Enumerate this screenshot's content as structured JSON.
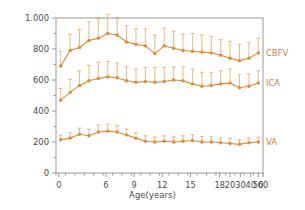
{
  "chart_data": {
    "type": "line",
    "title": "",
    "xlabel": "Age(years)",
    "ylabel": "Flow volumes (ml/min)",
    "ylim": [
      0,
      1000
    ],
    "yticks": [
      0,
      200,
      400,
      600,
      800,
      1000
    ],
    "ytick_labels": [
      "0",
      "200",
      "400",
      "600",
      "800",
      "1.000"
    ],
    "xtick_labels": [
      "0",
      "6",
      "9",
      "12",
      "15",
      "18",
      "20",
      "30",
      "40",
      "50",
      "60"
    ],
    "xtick_values": [
      0,
      6,
      9,
      12,
      15,
      18,
      20,
      30,
      40,
      50,
      60
    ],
    "x_scale": "ordinal-uneven",
    "grid": false,
    "legend_position": "right-inline",
    "errorbars": true,
    "marker": "circle",
    "line_color": "#e08a33",
    "axis_color": "#9a9a9a",
    "text_color": "#4a4a4a",
    "x": [
      0.5,
      1.5,
      2.5,
      3.5,
      4.5,
      5.5,
      6.5,
      7.5,
      8.5,
      9.5,
      10.5,
      11.5,
      12.5,
      13.5,
      14.5,
      15.5,
      16.5,
      17.5,
      18.5,
      19.5,
      20.5,
      21.5
    ],
    "series": [
      {
        "name": "CBFV",
        "label": "CBFV",
        "values": [
          690,
          790,
          810,
          855,
          870,
          900,
          890,
          845,
          830,
          820,
          770,
          820,
          805,
          790,
          785,
          780,
          775,
          760,
          740,
          725,
          740,
          775
        ],
        "errors": [
          95,
          105,
          115,
          120,
          130,
          125,
          110,
          105,
          100,
          110,
          120,
          115,
          110,
          105,
          115,
          110,
          105,
          100,
          110,
          105,
          100,
          95
        ]
      },
      {
        "name": "ICA",
        "label": "ICA",
        "values": [
          470,
          520,
          565,
          595,
          610,
          620,
          615,
          595,
          585,
          590,
          585,
          590,
          600,
          595,
          575,
          560,
          565,
          575,
          580,
          550,
          560,
          580
        ],
        "errors": [
          75,
          85,
          95,
          100,
          105,
          100,
          95,
          90,
          85,
          90,
          95,
          90,
          85,
          90,
          95,
          90,
          85,
          85,
          90,
          85,
          80,
          80
        ]
      },
      {
        "name": "VA",
        "label": "VA",
        "values": [
          215,
          225,
          250,
          240,
          265,
          270,
          265,
          245,
          225,
          205,
          200,
          205,
          200,
          205,
          210,
          200,
          200,
          195,
          190,
          185,
          195,
          200
        ],
        "errors": [
          30,
          35,
          40,
          42,
          45,
          45,
          40,
          38,
          35,
          35,
          32,
          35,
          33,
          35,
          38,
          35,
          33,
          32,
          35,
          30,
          30,
          30
        ]
      }
    ]
  }
}
